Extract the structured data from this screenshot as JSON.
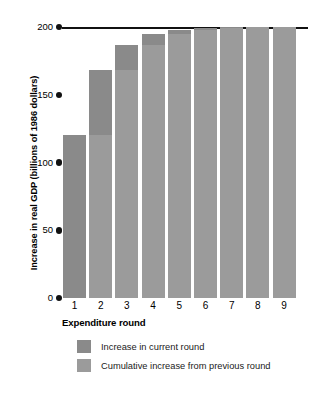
{
  "chart_data": {
    "type": "bar",
    "title": "",
    "subtitle": "",
    "xlabel": "Expenditure round",
    "ylabel": "Increase in real GDP (billions of 1986 dollars)",
    "categories": [
      "1",
      "2",
      "3",
      "4",
      "5",
      "6",
      "7",
      "8",
      "9"
    ],
    "ylim": [
      0,
      200
    ],
    "yticks": [
      0,
      50,
      100,
      150,
      200
    ],
    "ytick_labels": [
      "0",
      "50",
      "100",
      "150",
      "200"
    ],
    "grid": false,
    "reference_line": 200,
    "legend_position": "below-axes",
    "stacked": true,
    "series": [
      {
        "name": "Cumulative increase from previous round",
        "color": "#9b9b9b",
        "values": [
          0,
          120,
          168,
          187,
          195,
          198,
          199,
          200,
          200
        ]
      },
      {
        "name": "Increase in current round",
        "color": "#8a8a8a",
        "values": [
          120,
          48,
          19,
          8,
          3,
          1,
          1,
          0,
          0
        ]
      }
    ],
    "totals": [
      120,
      168,
      187,
      195,
      198,
      199,
      200,
      200,
      200
    ]
  },
  "axes": {
    "y_title": "Increase in real GDP (billions of 1986 dollars)",
    "x_title": "Expenditure round",
    "y_ticks": [
      {
        "label": "200",
        "value": 200
      },
      {
        "label": "150",
        "value": 150
      },
      {
        "label": "100",
        "value": 100
      },
      {
        "label": "50",
        "value": 50
      },
      {
        "label": "0",
        "value": 0
      }
    ],
    "x_ticks": [
      "1",
      "2",
      "3",
      "4",
      "5",
      "6",
      "7",
      "8",
      "9"
    ]
  },
  "legend": {
    "items": [
      {
        "label": "Increase in current round",
        "color": "#8a8a8a"
      },
      {
        "label": "Cumulative increase from previous round",
        "color": "#9b9b9b"
      }
    ]
  },
  "colors": {
    "current_round": "#8a8a8a",
    "cumulative": "#9b9b9b",
    "axis": "#111111",
    "background": "#ffffff"
  }
}
